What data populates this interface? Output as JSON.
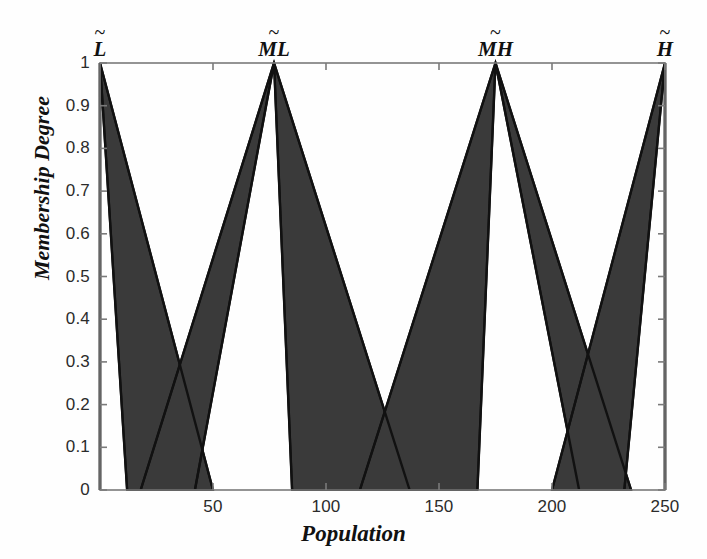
{
  "figure": {
    "width": 707,
    "height": 559,
    "background": "#ffffff",
    "fill_color": "#3a3a3a",
    "line_color": "#111111",
    "axis_color": "#7a7a7a"
  },
  "axes": {
    "xlabel": "Population",
    "ylabel": "Membership Degree",
    "xlim": [
      0,
      250
    ],
    "ylim": [
      0,
      1
    ],
    "xticks": [
      50,
      100,
      150,
      200,
      250
    ],
    "xticklabels": [
      "50",
      "100",
      "150",
      "200",
      "250"
    ],
    "yticks": [
      0,
      0.1,
      0.2,
      0.3,
      0.4,
      0.5,
      0.6,
      0.7,
      0.8,
      0.9,
      1
    ],
    "yticklabels": [
      "0",
      "0.1",
      "0.2",
      "0.3",
      "0.4",
      "0.5",
      "0.6",
      "0.7",
      "0.8",
      "0.9",
      "1"
    ],
    "grid": false,
    "plot_box": {
      "left": 100,
      "right": 665,
      "top": 63,
      "bottom": 490
    }
  },
  "chart_data": {
    "type": "line",
    "title": "",
    "xlabel": "Population",
    "ylabel": "Membership Degree",
    "xlim": [
      0,
      250
    ],
    "ylim": [
      0,
      1
    ],
    "grid": false,
    "legend": "none",
    "series": [
      {
        "name": "L",
        "label_tilde": "L̃",
        "peak": 0,
        "umf": {
          "x": [
            0,
            0,
            50
          ],
          "y": [
            0,
            1,
            0
          ]
        },
        "lmf": {
          "x": [
            0,
            0,
            12
          ],
          "y": [
            0,
            1,
            0
          ]
        }
      },
      {
        "name": "ML",
        "label_tilde": "ML̃",
        "peak": 77,
        "umf": {
          "x": [
            18,
            77,
            137
          ],
          "y": [
            0,
            1,
            0
          ]
        },
        "lmf": {
          "x": [
            42,
            77,
            85
          ],
          "y": [
            0,
            1,
            0
          ]
        }
      },
      {
        "name": "MH",
        "label_tilde": "MH̃",
        "peak": 175,
        "umf": {
          "x": [
            115,
            175,
            235
          ],
          "y": [
            0,
            1,
            0
          ]
        },
        "lmf": {
          "x": [
            167,
            175,
            212
          ],
          "y": [
            0,
            1,
            0
          ]
        }
      },
      {
        "name": "H",
        "label_tilde": "H̃",
        "peak": 250,
        "umf": {
          "x": [
            200,
            250,
            250
          ],
          "y": [
            0,
            1,
            0
          ]
        },
        "lmf": {
          "x": [
            232,
            250,
            250
          ],
          "y": [
            0,
            1,
            0
          ]
        }
      }
    ],
    "annotations": [
      {
        "text": "L",
        "x": 0,
        "y": 1.06
      },
      {
        "text": "ML",
        "x": 77,
        "y": 1.06
      },
      {
        "text": "MH",
        "x": 175,
        "y": 1.06
      },
      {
        "text": "H",
        "x": 250,
        "y": 1.06
      }
    ]
  },
  "set_labels": [
    {
      "base": "L",
      "tilde": "~"
    },
    {
      "base": "ML",
      "tilde": "~"
    },
    {
      "base": "MH",
      "tilde": "~"
    },
    {
      "base": "H",
      "tilde": "~"
    }
  ]
}
